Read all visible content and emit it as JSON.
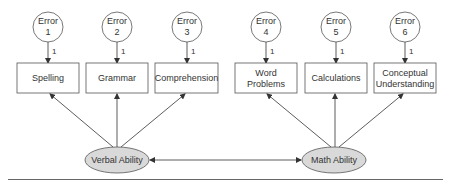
{
  "diagram": {
    "errors": [
      {
        "line1": "Error",
        "line2": "1",
        "loading": "1"
      },
      {
        "line1": "Error",
        "line2": "2",
        "loading": "1"
      },
      {
        "line1": "Error",
        "line2": "3",
        "loading": "1"
      },
      {
        "line1": "Error",
        "line2": "4",
        "loading": "1"
      },
      {
        "line1": "Error",
        "line2": "5",
        "loading": "1"
      },
      {
        "line1": "Error",
        "line2": "6",
        "loading": "1"
      }
    ],
    "observed": [
      {
        "line1": "Spelling",
        "line2": ""
      },
      {
        "line1": "Grammar",
        "line2": ""
      },
      {
        "line1": "Comprehension",
        "line2": ""
      },
      {
        "line1": "Word",
        "line2": "Problems"
      },
      {
        "line1": "Calculations",
        "line2": ""
      },
      {
        "line1": "Conceptual",
        "line2": "Understanding"
      }
    ],
    "latent": [
      {
        "label": "Verbal Ability"
      },
      {
        "label": "Math Ability"
      }
    ],
    "colors": {
      "latent_fill": "#d9d9d9",
      "stroke": "#555555"
    }
  }
}
